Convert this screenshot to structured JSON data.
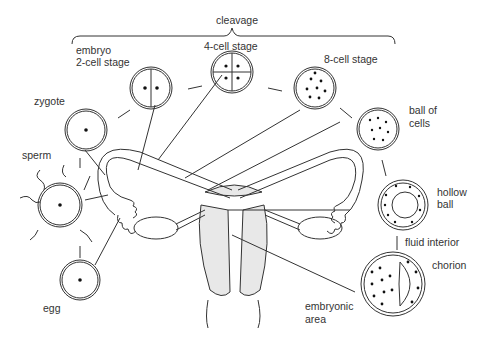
{
  "diagram": {
    "bracket_label": "cleavage",
    "labels": {
      "embryo": "embryo",
      "two_cell": "2-cell stage",
      "four_cell": "4-cell stage",
      "eight_cell": "8-cell stage",
      "zygote": "zygote",
      "sperm": "sperm",
      "egg": "egg",
      "ball1": "ball of",
      "ball2": "cells",
      "hollow1": "hollow",
      "hollow2": "ball",
      "fluid": "fluid interior",
      "chorion": "chorion",
      "embryonic1": "embryonic",
      "embryonic2": "area"
    },
    "stages": [
      "egg",
      "sperm",
      "zygote",
      "2-cell stage",
      "4-cell stage",
      "8-cell stage",
      "ball of cells",
      "hollow ball",
      "chorion / embryonic area"
    ]
  }
}
